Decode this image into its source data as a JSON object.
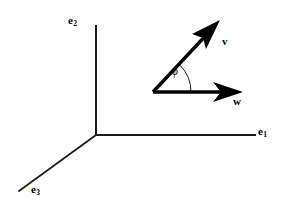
{
  "figure": {
    "background_color": "#ffffff",
    "stroke_color": "#000000",
    "width": 284,
    "height": 208
  },
  "axes": {
    "origin": {
      "x": 96,
      "y": 135
    },
    "items": [
      {
        "name": "e1",
        "label_base": "e",
        "label_sub": "1",
        "direction": "right",
        "end": {
          "x": 255,
          "y": 135
        },
        "stroke_width": 2
      },
      {
        "name": "e2",
        "label_base": "e",
        "label_sub": "2",
        "direction": "up",
        "end": {
          "x": 96,
          "y": 26
        },
        "stroke_width": 2
      },
      {
        "name": "e3",
        "label_base": "e",
        "label_sub": "3",
        "direction": "down-left",
        "end": {
          "x": 19,
          "y": 191
        },
        "stroke_width": 1.6
      }
    ]
  },
  "vectors": {
    "origin": {
      "x": 153,
      "y": 92
    },
    "items": [
      {
        "name": "v",
        "label": "v",
        "tip": {
          "x": 219,
          "y": 21
        },
        "stroke_width": 3.2,
        "bold": true
      },
      {
        "name": "w",
        "label": "w",
        "tip": {
          "x": 242,
          "y": 92
        },
        "stroke_width": 3.2,
        "bold": true
      }
    ]
  },
  "angle": {
    "name": "phi",
    "label": "ϕ",
    "between": [
      "w",
      "v"
    ],
    "arc_radius": 38,
    "arc_stroke_width": 1,
    "vertex": {
      "x": 153,
      "y": 92
    }
  }
}
